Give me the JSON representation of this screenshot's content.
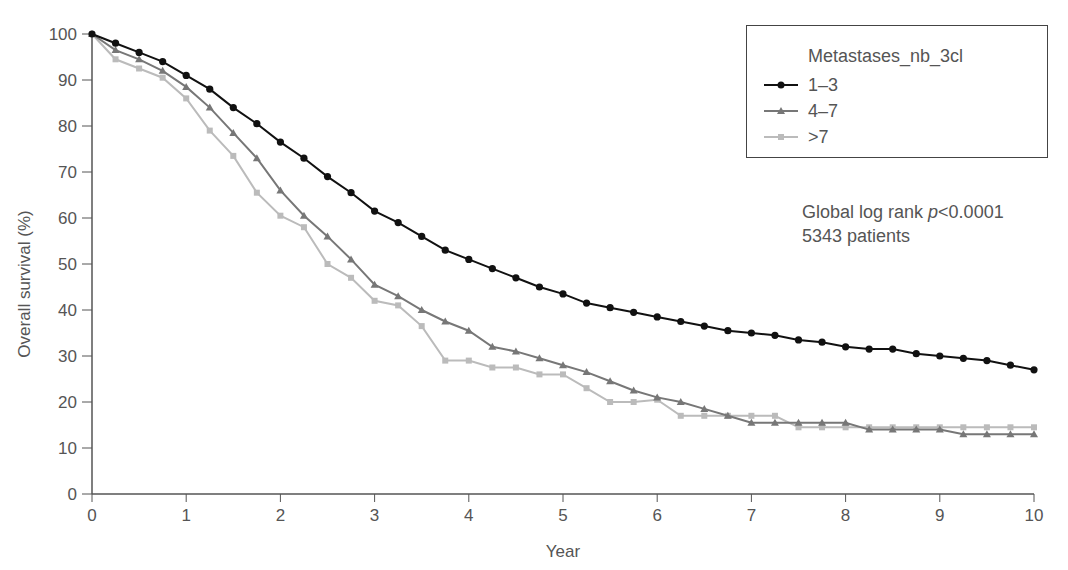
{
  "chart_data": {
    "type": "line",
    "title": "",
    "xlabel": "Year",
    "ylabel": "Overall survival (%)",
    "xlim": [
      0,
      10
    ],
    "ylim": [
      0,
      100
    ],
    "x_ticks": [
      "0",
      "1",
      "2",
      "3",
      "4",
      "5",
      "6",
      "7",
      "8",
      "9",
      "10"
    ],
    "y_ticks": [
      "0",
      "10",
      "20",
      "30",
      "40",
      "50",
      "60",
      "70",
      "80",
      "90",
      "100"
    ],
    "grid": false,
    "legend_position": "top-right",
    "legend_title": "Metastases_nb_3cl",
    "x": [
      0,
      0.25,
      0.5,
      0.75,
      1,
      1.25,
      1.5,
      1.75,
      2,
      2.25,
      2.5,
      2.75,
      3,
      3.25,
      3.5,
      3.75,
      4,
      4.25,
      4.5,
      4.75,
      5,
      5.25,
      5.5,
      5.75,
      6,
      6.25,
      6.5,
      6.75,
      7,
      7.25,
      7.5,
      7.75,
      8,
      8.25,
      8.5,
      8.75,
      9,
      9.25,
      9.5,
      9.75,
      10
    ],
    "series": [
      {
        "name": "1–3",
        "color": "#111111",
        "marker": "circle",
        "values": [
          100,
          98,
          96,
          94,
          91,
          88,
          84,
          80.5,
          76.5,
          73,
          69,
          65.5,
          61.5,
          59,
          56,
          53,
          51,
          49,
          47,
          45,
          43.5,
          41.5,
          40.5,
          39.5,
          38.5,
          37.5,
          36.5,
          35.5,
          35,
          34.5,
          33.5,
          33,
          32,
          31.5,
          31.5,
          30.5,
          30,
          29.5,
          29,
          28,
          27
        ]
      },
      {
        "name": "4–7",
        "color": "#777777",
        "marker": "triangle",
        "values": [
          100,
          96.5,
          94.5,
          92,
          88.5,
          84,
          78.5,
          73,
          66,
          60.5,
          56,
          51,
          45.5,
          43,
          40,
          37.5,
          35.5,
          32,
          31,
          29.5,
          28,
          26.5,
          24.5,
          22.5,
          21,
          20,
          18.5,
          17,
          15.5,
          15.5,
          15.5,
          15.5,
          15.5,
          14,
          14,
          14,
          14,
          13,
          13,
          13,
          13
        ]
      },
      {
        "name": ">7",
        "color": "#bbbbbb",
        "marker": "square",
        "values": [
          100,
          94.5,
          92.5,
          90.5,
          86,
          79,
          73.5,
          65.5,
          60.5,
          58,
          50,
          47,
          42,
          41,
          36.5,
          29,
          29,
          27.5,
          27.5,
          26,
          26,
          23,
          20,
          20,
          20.5,
          17,
          17,
          17,
          17,
          17,
          14.5,
          14.5,
          14.5,
          14.5,
          14.5,
          14.5,
          14.5,
          14.5,
          14.5,
          14.5,
          14.5
        ]
      }
    ],
    "annotations": [
      "Global log rank p<0.0001",
      "5343 patients"
    ]
  },
  "legend": {
    "title": "Metastases_nb_3cl",
    "items": [
      {
        "label": "1–3"
      },
      {
        "label": "4–7"
      },
      {
        "label": ">7"
      }
    ]
  },
  "annotation": {
    "line1_prefix": "Global log rank ",
    "line1_p": "p",
    "line1_suffix": "<0.0001",
    "line2": "5343 patients"
  }
}
